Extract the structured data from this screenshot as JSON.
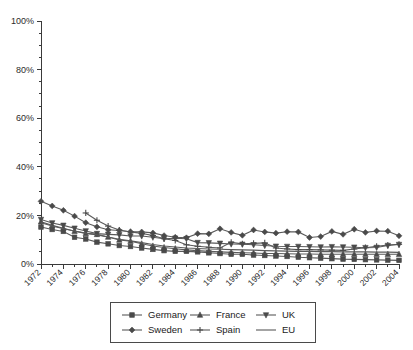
{
  "chart_data": {
    "type": "line",
    "title": "",
    "subtitle": "",
    "xlabel": "",
    "ylabel": "",
    "ylim": [
      0,
      100
    ],
    "xlim": [
      1972,
      2004
    ],
    "y_tick_labels": [
      "0%",
      "20%",
      "40%",
      "60%",
      "80%",
      "100%"
    ],
    "y_ticks": [
      0,
      20,
      40,
      60,
      80,
      100
    ],
    "y_minor_tick_step": 5,
    "x_tick_labels": [
      "1972",
      "1974",
      "1976",
      "1978",
      "1980",
      "1982",
      "1984",
      "1986",
      "1988",
      "1990",
      "1992",
      "1994",
      "1996",
      "1998",
      "2000",
      "2002",
      "2004"
    ],
    "x_tick_step": 1,
    "x_label_step": 2,
    "x_label_rotation_deg": 45,
    "grid": false,
    "legend_position": "bottom",
    "legend_columns": 3,
    "x": [
      1972,
      1973,
      1974,
      1975,
      1976,
      1977,
      1978,
      1979,
      1980,
      1981,
      1982,
      1983,
      1984,
      1985,
      1986,
      1987,
      1988,
      1989,
      1990,
      1991,
      1992,
      1993,
      1994,
      1995,
      1996,
      1997,
      1998,
      1999,
      2000,
      2001,
      2002,
      2003,
      2004
    ],
    "series": [
      {
        "name": "Germany",
        "marker": "square",
        "values": [
          15.2,
          14.2,
          13.4,
          11.0,
          10.3,
          9.0,
          8.3,
          7.6,
          7.2,
          6.6,
          6.0,
          5.5,
          5.2,
          5.2,
          5.0,
          4.6,
          4.3,
          4.0,
          4.0,
          3.7,
          3.5,
          3.3,
          3.1,
          2.8,
          2.6,
          2.4,
          2.2,
          2.0,
          1.9,
          1.8,
          1.7,
          1.6,
          1.5
        ]
      },
      {
        "name": "Sweden",
        "marker": "diamond",
        "values": [
          25.8,
          23.9,
          22.1,
          19.7,
          17.0,
          15.3,
          14.1,
          13.8,
          13.3,
          13.2,
          12.8,
          11.7,
          11.0,
          10.8,
          12.5,
          12.4,
          14.5,
          13.0,
          11.8,
          14.0,
          13.2,
          12.7,
          13.3,
          13.2,
          10.9,
          11.3,
          13.4,
          12.2,
          14.3,
          13.0,
          13.6,
          13.5,
          11.6
        ]
      },
      {
        "name": "France",
        "marker": "triangle-up",
        "values": [
          17.4,
          15.9,
          14.7,
          13.5,
          12.6,
          12.2,
          11.1,
          9.9,
          9.4,
          8.3,
          7.4,
          6.8,
          6.3,
          5.8,
          5.5,
          5.2,
          5.0,
          4.8,
          4.6,
          4.5,
          4.3,
          4.3,
          4.2,
          4.1,
          4.1,
          4.0,
          4.0,
          4.0,
          4.0,
          4.0,
          4.0,
          4.0,
          4.0
        ]
      },
      {
        "name": "Spain",
        "marker": "plus",
        "values": [
          null,
          null,
          null,
          null,
          21.0,
          18.0,
          15.6,
          14.0,
          13.2,
          12.6,
          11.7,
          10.4,
          9.7,
          7.9,
          7.3,
          6.9,
          6.6,
          8.9,
          8.3,
          8.5,
          8.7,
          6.6,
          6.2,
          5.9,
          5.9,
          5.8,
          5.7,
          5.6,
          6.2,
          6.7,
          7.3,
          7.8,
          8.1
        ]
      },
      {
        "name": "UK",
        "marker": "triangle-down",
        "values": [
          18.3,
          16.9,
          15.9,
          14.7,
          13.6,
          12.5,
          12.2,
          12.0,
          11.5,
          11.5,
          11.0,
          10.4,
          10.6,
          10.4,
          8.8,
          8.7,
          8.5,
          8.2,
          8.1,
          7.9,
          7.6,
          7.3,
          7.2,
          7.2,
          7.1,
          7.0,
          7.1,
          7.0,
          6.9,
          6.7,
          6.8,
          7.6,
          8.0
        ]
      },
      {
        "name": "EU",
        "marker": "none",
        "values": [
          17.0,
          15.6,
          14.5,
          13.6,
          12.7,
          12.0,
          11.1,
          10.2,
          9.6,
          8.8,
          8.0,
          7.4,
          7.0,
          6.6,
          6.4,
          6.2,
          6.1,
          5.9,
          5.8,
          5.7,
          5.5,
          5.4,
          5.3,
          5.2,
          5.2,
          5.1,
          5.1,
          5.0,
          5.0,
          5.0,
          4.9,
          4.9,
          4.8
        ]
      }
    ]
  },
  "legend": {
    "items": [
      {
        "label": "Germany",
        "marker": "square"
      },
      {
        "label": "France",
        "marker": "triangle-up"
      },
      {
        "label": "UK",
        "marker": "triangle-down"
      },
      {
        "label": "Sweden",
        "marker": "diamond"
      },
      {
        "label": "Spain",
        "marker": "plus"
      },
      {
        "label": "EU",
        "marker": "none"
      }
    ]
  },
  "colors": {
    "line": "#5a5a5a",
    "marker": "#4a4a4a",
    "axis": "#3a3a3a",
    "text": "#1a1a1a",
    "background": "#ffffff"
  }
}
